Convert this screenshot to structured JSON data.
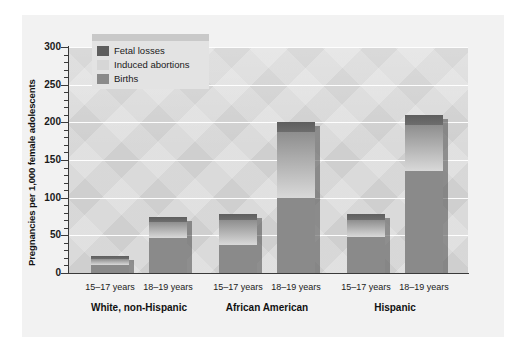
{
  "chart_data": {
    "type": "bar",
    "subtype": "stacked-grouped",
    "title": "",
    "xlabel": "",
    "ylabel": "Pregnancies per 1,000 female adolescents",
    "ylim": [
      0,
      300
    ],
    "yticks": [
      0,
      50,
      100,
      150,
      200,
      250,
      300
    ],
    "ytick_labels": [
      "0",
      "50",
      "100",
      "150",
      "200",
      "250",
      "300"
    ],
    "minor_tick_interval": 10,
    "grid": "horizontal-white",
    "legend_position": "top-left-inside",
    "legend": [
      "Fetal losses",
      "Induced abortions",
      "Births"
    ],
    "series": [
      {
        "name": "Births",
        "color": "#8a8a8a",
        "values": [
          11,
          46,
          37,
          100,
          48,
          135
        ]
      },
      {
        "name": "Induced abortions",
        "color": "#d6d6d6",
        "values": [
          8,
          22,
          33,
          87,
          23,
          62
        ]
      },
      {
        "name": "Fetal losses",
        "color": "#5e5e5e",
        "values": [
          4,
          7,
          8,
          13,
          7,
          13
        ]
      }
    ],
    "categories": [
      "White, non-Hispanic 15-17 years",
      "White, non-Hispanic 18-19 years",
      "African American 15-17 years",
      "African American 18-19 years",
      "Hispanic 15-17 years",
      "Hispanic 18-19 years"
    ],
    "totals": [
      23,
      75,
      78,
      200,
      78,
      210
    ],
    "groups": [
      {
        "label": "White, non-Hispanic",
        "ages": [
          "15–17 years",
          "18–19 years"
        ]
      },
      {
        "label": "African American",
        "ages": [
          "15–17 years",
          "18–19 years"
        ]
      },
      {
        "label": "Hispanic",
        "ages": [
          "15–17 years",
          "18–19 years"
        ]
      }
    ]
  },
  "colors": {
    "fetal": "#5e5e5e",
    "induced": "#d6d6d6",
    "births": "#8a8a8a",
    "plot_bg": "#cfcfcf",
    "panel_bg": "#f2f2f2",
    "axis": "#3a3a3a",
    "gridline": "#ffffff"
  }
}
